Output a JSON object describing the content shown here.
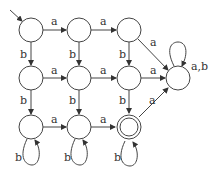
{
  "diagram": {
    "type": "finite-automaton",
    "states": [
      {
        "id": "q00",
        "x": 31,
        "y": 30,
        "start": true,
        "accepting": false
      },
      {
        "id": "q01",
        "x": 79,
        "y": 30,
        "start": false,
        "accepting": false
      },
      {
        "id": "q02",
        "x": 129,
        "y": 30,
        "start": false,
        "accepting": false
      },
      {
        "id": "q10",
        "x": 31,
        "y": 78,
        "start": false,
        "accepting": false
      },
      {
        "id": "q11",
        "x": 79,
        "y": 78,
        "start": false,
        "accepting": false
      },
      {
        "id": "q12",
        "x": 129,
        "y": 78,
        "start": false,
        "accepting": false
      },
      {
        "id": "sink",
        "x": 178,
        "y": 78,
        "start": false,
        "accepting": false
      },
      {
        "id": "q20",
        "x": 31,
        "y": 127,
        "start": false,
        "accepting": false
      },
      {
        "id": "q21",
        "x": 79,
        "y": 127,
        "start": false,
        "accepting": false
      },
      {
        "id": "q22",
        "x": 129,
        "y": 127,
        "start": false,
        "accepting": true
      }
    ],
    "edges": [
      {
        "from": "q00",
        "to": "q01",
        "label": "a"
      },
      {
        "from": "q01",
        "to": "q02",
        "label": "a"
      },
      {
        "from": "q02",
        "to": "sink",
        "label": "a"
      },
      {
        "from": "q00",
        "to": "q10",
        "label": "b"
      },
      {
        "from": "q01",
        "to": "q11",
        "label": "b"
      },
      {
        "from": "q02",
        "to": "q12",
        "label": "b"
      },
      {
        "from": "q10",
        "to": "q11",
        "label": "a"
      },
      {
        "from": "q11",
        "to": "q12",
        "label": "a"
      },
      {
        "from": "q12",
        "to": "sink",
        "label": "a"
      },
      {
        "from": "q10",
        "to": "q20",
        "label": "b"
      },
      {
        "from": "q11",
        "to": "q21",
        "label": "b"
      },
      {
        "from": "q12",
        "to": "q22",
        "label": "b"
      },
      {
        "from": "q20",
        "to": "q21",
        "label": "a"
      },
      {
        "from": "q21",
        "to": "q22",
        "label": "a"
      },
      {
        "from": "q22",
        "to": "sink",
        "label": "a"
      },
      {
        "from": "q20",
        "to": "q20",
        "label": "b"
      },
      {
        "from": "q21",
        "to": "q21",
        "label": "b"
      },
      {
        "from": "q22",
        "to": "q22",
        "label": "b"
      },
      {
        "from": "sink",
        "to": "sink",
        "label": "a,b"
      }
    ]
  },
  "labels": {
    "e_00_01": "a",
    "e_01_02": "a",
    "e_02_s": "a",
    "e_00_10": "b",
    "e_01_11": "b",
    "e_02_12": "b",
    "e_10_11": "a",
    "e_11_12": "a",
    "e_12_s": "a",
    "e_10_20": "b",
    "e_11_21": "b",
    "e_12_22": "b",
    "e_20_21": "a",
    "e_21_22": "a",
    "e_22_s": "a",
    "l_20": "b",
    "l_21": "b",
    "l_22": "b",
    "l_s": "a,b"
  }
}
